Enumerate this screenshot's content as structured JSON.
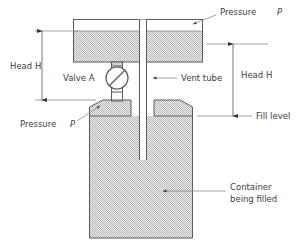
{
  "diagram": {
    "type": "engineering-schematic",
    "background_color": "#ffffff",
    "line_color": "#5a5a5a",
    "fill_color": "#d7d7d7",
    "text_color": "#3d3d3d"
  },
  "labels": {
    "pressure_top": "Pressure",
    "pressure_top_symbol": "P",
    "pressure_bottom": "Pressure",
    "pressure_bottom_symbol": "P",
    "head_left": "Head H",
    "head_right": "Head H",
    "valve": "Valve A",
    "vent_tube": "Vent tube",
    "fill_level": "Fill level",
    "container_line1": "Container",
    "container_line2": "being filled"
  },
  "components": {
    "supply_tank": {
      "name": "supply-tank",
      "x": 73,
      "y": 19,
      "width": 130,
      "height": 43,
      "liquid_surface_y": 31
    },
    "vent_tube": {
      "name": "vent-tube",
      "x": 139,
      "y": 19,
      "width": 7,
      "bottom_y": 160
    },
    "valve": {
      "name": "valve-a",
      "center_x": 117,
      "center_y": 78,
      "radius": 11
    },
    "container": {
      "name": "container-being-filled",
      "x": 89,
      "y": 116,
      "width": 104,
      "height": 122,
      "funnel_top_y": 100
    }
  },
  "dimensions": {
    "head_left": {
      "x": 42,
      "y_top": 31,
      "y_bottom": 100
    },
    "head_right": {
      "x": 233,
      "y_top": 44,
      "y_bottom": 116
    }
  }
}
